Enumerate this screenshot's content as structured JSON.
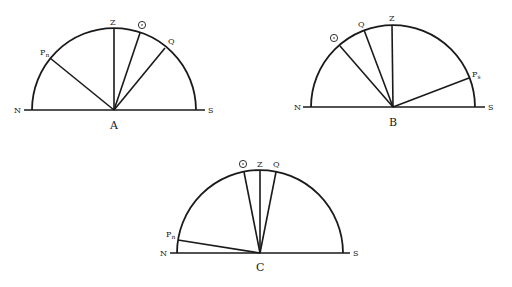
{
  "diagrams": [
    {
      "id": "A",
      "caption": "A",
      "center": [
        114,
        110
      ],
      "radius": 82,
      "baseline": [
        24,
        205
      ],
      "labels": {
        "north": "N",
        "south": "S",
        "zenith": "Z",
        "sun": "sun-symbol",
        "equator": "Q",
        "pole": "P",
        "pole_sub": "n"
      },
      "points": {
        "zenith_end": [
          114,
          28
        ],
        "sun_end": [
          140,
          33
        ],
        "equator_end": [
          165,
          48
        ],
        "pole_end": [
          50,
          58
        ]
      }
    },
    {
      "id": "B",
      "caption": "B",
      "center": [
        393,
        107
      ],
      "radius": 82,
      "baseline": [
        303,
        485
      ],
      "labels": {
        "north": "N",
        "south": "S",
        "zenith": "Z",
        "sun": "sun-symbol",
        "equator": "Q",
        "pole": "P",
        "pole_sub": "s"
      },
      "points": {
        "zenith_end": [
          392,
          25
        ],
        "sun_end": [
          340,
          45
        ],
        "equator_end": [
          365,
          30
        ],
        "pole_end": [
          469,
          78
        ]
      }
    },
    {
      "id": "C",
      "caption": "C",
      "center": [
        260,
        253
      ],
      "radius": 83,
      "baseline": [
        170,
        350
      ],
      "labels": {
        "north": "N",
        "south": "S",
        "zenith": "Z",
        "sun": "sun-symbol",
        "equator": "Q",
        "pole": "P",
        "pole_sub": "n"
      },
      "points": {
        "zenith_end": [
          260,
          170
        ],
        "sun_end": [
          244,
          172
        ],
        "equator_end": [
          276,
          172
        ],
        "pole_end": [
          178,
          240
        ]
      }
    }
  ]
}
